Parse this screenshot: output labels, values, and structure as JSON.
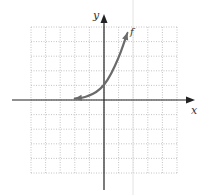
{
  "chart_data": {
    "type": "line",
    "title": "",
    "xlabel": "x",
    "ylabel": "y",
    "xlim": [
      -5,
      5
    ],
    "ylim": [
      -5,
      5
    ],
    "grid": true,
    "grid_style": "dotted",
    "series": [
      {
        "name": "f",
        "description": "exponential growth curve, horizontal asymptote y=0 to the left, passes through (0,1)",
        "x": [
          -2.0,
          -1.5,
          -1.0,
          -0.5,
          0.0,
          0.5,
          1.0,
          1.3,
          1.6
        ],
        "y": [
          0.1,
          0.15,
          0.3,
          0.55,
          1.0,
          1.8,
          2.9,
          3.7,
          4.6
        ],
        "color": "#6b6b6b",
        "arrows": "both"
      }
    ]
  },
  "labels": {
    "x_axis": "x",
    "y_axis": "y",
    "curve": "f"
  },
  "colors": {
    "axis": "#222222",
    "grid": "#b5b5b5",
    "curve": "#6b6b6b"
  }
}
